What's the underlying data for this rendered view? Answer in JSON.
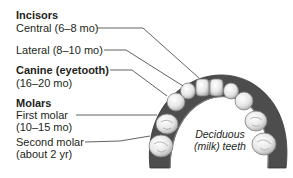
{
  "diagram": {
    "labels": {
      "incisors_heading": "Incisors",
      "central": "Central (6–8 mo)",
      "lateral": "Lateral (8–10 mo)",
      "canine_heading": "Canine (eyetooth)",
      "canine_age": "(16–20 mo)",
      "molars_heading": "Molars",
      "first_molar": "First molar",
      "first_molar_age": "(10–15 mo)",
      "second_molar": "Second molar",
      "second_molar_age": "(about 2 yr)"
    },
    "caption_line1": "Deciduous",
    "caption_line2": "(milk) teeth",
    "colors": {
      "text": "#231f20",
      "leader_line": "#3a3a3a",
      "gum": "#4a4a4a",
      "tooth": "#f2f2f2",
      "tooth_shadow": "#9a9a9a"
    }
  }
}
